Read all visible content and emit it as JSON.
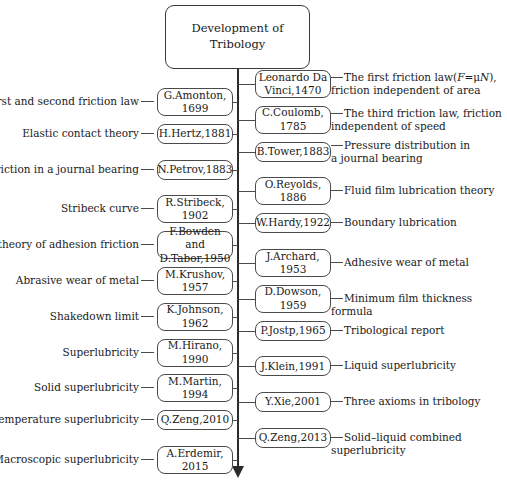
{
  "title": {
    "line1": "Development of",
    "line2": "Tribology"
  },
  "left_entries": [
    {
      "label": "The first and second friction law",
      "person": "G.Amonton,\n1699"
    },
    {
      "label": "Elastic contact theory",
      "person": "H.Hertz,1881"
    },
    {
      "label": "Friction in a journal bearing",
      "person": "N.Petrov,1883"
    },
    {
      "label": "Stribeck curve",
      "person": "R.Stribeck,\n1902"
    },
    {
      "label": "The theory of adhesion friction",
      "person": "F.Bowden and\nD.Tabor,1950"
    },
    {
      "label": "Abrasive wear of metal",
      "person": "M.Krushov,\n1957"
    },
    {
      "label": "Shakedown limit",
      "person": "K.Johnson,\n1962"
    },
    {
      "label": "Superlubricity",
      "person": "M.Hirano,\n1990"
    },
    {
      "label": "Solid superlubricity",
      "person": "M.Martin,\n1994"
    },
    {
      "label": "High temperature superlubricity",
      "person": "Q.Zeng,2010"
    },
    {
      "label": "Macroscopic superlubricity",
      "person": "A.Erdemir,\n2015"
    }
  ],
  "right_entries": [
    {
      "person": "Leonardo Da\nVinci,1470",
      "label": "The first friction law(F=μN),\nfriction independent of area"
    },
    {
      "person": "C.Coulomb,\n1785",
      "label": "The third friction law, friction\nindependent of speed"
    },
    {
      "person": "B.Tower,1883",
      "label": "Pressure distribution in\na journal bearing"
    },
    {
      "person": "O.Reyolds,\n1886",
      "label": "Fluid film lubrication theory"
    },
    {
      "person": "W.Hardy,1922",
      "label": "Boundary lubrication"
    },
    {
      "person": "J.Archard,\n1953",
      "label": "Adhesive wear of metal"
    },
    {
      "person": "D.Dowson,\n1959",
      "label": "Minimum film thickness formula"
    },
    {
      "person": "P.Jostp,1965",
      "label": "Tribological report"
    },
    {
      "person": "J.Klein,1991",
      "label": "Liquid superlubricity"
    },
    {
      "person": "Y.Xie,2001",
      "label": "Three axioms in tribology"
    },
    {
      "person": "Q.Zeng,2013",
      "label": "Solid–liquid combined superlubricity"
    }
  ],
  "axis": {
    "name": "timeline-axis",
    "direction": "downward",
    "color": "#2b2b2b"
  }
}
